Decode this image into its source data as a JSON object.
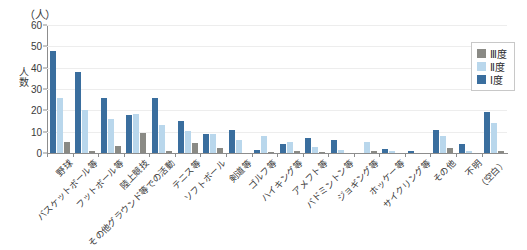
{
  "chart_data": {
    "type": "bar",
    "title": "",
    "xlabel": "",
    "ylabel": "人数",
    "unit_label": "（人）",
    "ylim": [
      0,
      60
    ],
    "yticks": [
      0,
      10,
      20,
      30,
      40,
      50,
      60
    ],
    "grid": true,
    "legend_position": "top-right",
    "categories": [
      "野球",
      "バスケットボール等",
      "フットボール等",
      "陸上競技",
      "その他グラウンド等での活動",
      "テニス等",
      "ソフトボール",
      "剣道等",
      "ゴルフ等",
      "ハイキング等",
      "アメフト等",
      "バドミントン等",
      "ジョギング等",
      "ホッケー等",
      "サイクリング等",
      "その他",
      "不明",
      "（空白）"
    ],
    "series": [
      {
        "name": "Ⅲ度",
        "color": "#8a8a85",
        "values": [
          5,
          1,
          3.5,
          9.5,
          1,
          4.5,
          2.5,
          0,
          0.5,
          1,
          0.5,
          0,
          1,
          0,
          0,
          2.5,
          0,
          1
        ]
      },
      {
        "name": "Ⅱ度",
        "color": "#b9d7ec",
        "values": [
          26,
          20,
          16,
          18.5,
          13,
          10.5,
          9,
          6,
          8,
          5,
          3,
          1.5,
          5,
          1,
          0,
          8,
          1,
          14
        ]
      },
      {
        "name": "Ⅰ度",
        "color": "#3a6e9e",
        "values": [
          48,
          38,
          26,
          18,
          26,
          15,
          9,
          11,
          1.5,
          4,
          7,
          6,
          0,
          2,
          1,
          11,
          4,
          19
        ]
      }
    ],
    "draw_order": [
      "Ⅰ度",
      "Ⅱ度",
      "Ⅲ度"
    ],
    "legend": [
      {
        "label": "Ⅲ度",
        "color": "#8a8a85"
      },
      {
        "label": "Ⅱ度",
        "color": "#b9d7ec"
      },
      {
        "label": "Ⅰ度",
        "color": "#3a6e9e"
      }
    ]
  }
}
